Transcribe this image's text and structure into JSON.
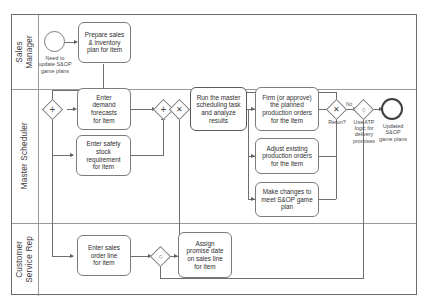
{
  "diagram": {
    "type": "bpmn-swimlane"
  },
  "lanes": [
    {
      "id": "sales-manager",
      "label": "Sales\nManager"
    },
    {
      "id": "master-scheduler",
      "label": "Master Scheduler"
    },
    {
      "id": "customer-service-rep",
      "label": "Customer\nService Rep"
    }
  ],
  "events": [
    {
      "id": "start-update-sop",
      "kind": "start",
      "label": "Need to\nupdate S&OP\ngame plans"
    },
    {
      "id": "end-updated-sop",
      "kind": "end",
      "label": "Updated\nS&OP\ngame plans"
    }
  ],
  "tasks": [
    {
      "id": "prepare-sales-inventory-plan",
      "label": "Prepare sales\n& inventory\nplan for item",
      "lane": "sales-manager"
    },
    {
      "id": "enter-demand-forecasts",
      "label": "Enter\ndemand\nforecasts\nfor item",
      "lane": "master-scheduler"
    },
    {
      "id": "enter-safety-stock",
      "label": "Enter safety\nstock\nrequirement\nfor item",
      "lane": "master-scheduler"
    },
    {
      "id": "run-master-scheduling",
      "label": "Run the master\nscheduling task\nand analyze\nresults",
      "lane": "master-scheduler",
      "emphasis": true
    },
    {
      "id": "firm-planned-orders",
      "label": "Firm (or approve)\nthe planned\nproduction orders\nfor the item",
      "lane": "master-scheduler"
    },
    {
      "id": "adjust-existing-orders",
      "label": "Adjust existing\nproduction orders\nfor the item",
      "lane": "master-scheduler"
    },
    {
      "id": "make-changes-sop",
      "label": "Make changes to\nmeet S&OP game\nplan",
      "lane": "master-scheduler"
    },
    {
      "id": "enter-sales-order-line",
      "label": "Enter sales\norder line\nfor item",
      "lane": "customer-service-rep"
    },
    {
      "id": "assign-promise-date",
      "label": "Assign\npromise date\non sales line\nfor item",
      "lane": "customer-service-rep"
    }
  ],
  "gateways": [
    {
      "id": "gw-split-parallel",
      "marker": "+",
      "label": ""
    },
    {
      "id": "gw-join-parallel",
      "marker": "+",
      "label": ""
    },
    {
      "id": "gw-complex",
      "marker": "✕",
      "label": ""
    },
    {
      "id": "gw-rerun",
      "marker": "✕",
      "label": "Rerun?"
    },
    {
      "id": "gw-atp",
      "marker": "○",
      "label": "Use ATP\nlogic for\ndelivery\npromises"
    },
    {
      "id": "gw-sales-join",
      "marker": "○",
      "label": ""
    }
  ],
  "flow_labels": [
    {
      "id": "rerun-no",
      "text": "No"
    }
  ],
  "colors": {
    "pool_border": "#6b6b6b",
    "lane_divider": "#9a9a9a",
    "task_border": "#7b7b7b",
    "connector": "#6e6e6e",
    "text": "#2e2e2e",
    "background": "#ffffff"
  }
}
